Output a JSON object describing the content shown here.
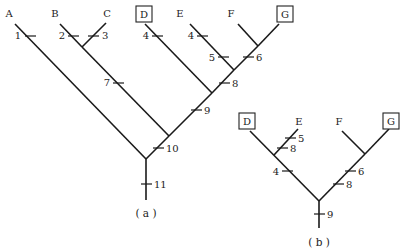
{
  "diagram": {
    "type": "cladogram",
    "tree_a": {
      "caption": "( a )",
      "taxa": [
        {
          "name": "A",
          "boxed": false
        },
        {
          "name": "B",
          "boxed": false
        },
        {
          "name": "C",
          "boxed": false
        },
        {
          "name": "D",
          "boxed": true
        },
        {
          "name": "E",
          "boxed": false
        },
        {
          "name": "F",
          "boxed": false
        },
        {
          "name": "G",
          "boxed": true
        }
      ],
      "characters": {
        "A": "1",
        "B": "2",
        "C": "3",
        "D": "4",
        "E": "4",
        "BC": "7",
        "E_stem": "5",
        "FG": "6",
        "EFG": "8",
        "DEFG": "9",
        "BCDEFG": "10",
        "root": "11"
      }
    },
    "tree_b": {
      "caption": "( b )",
      "taxa": [
        {
          "name": "D",
          "boxed": true
        },
        {
          "name": "E",
          "boxed": false
        },
        {
          "name": "F",
          "boxed": false
        },
        {
          "name": "G",
          "boxed": true
        }
      ],
      "characters": {
        "E_5": "5",
        "E_8": "8",
        "DE": "4",
        "FG_6": "6",
        "FG_8": "8",
        "root": "9"
      }
    }
  }
}
